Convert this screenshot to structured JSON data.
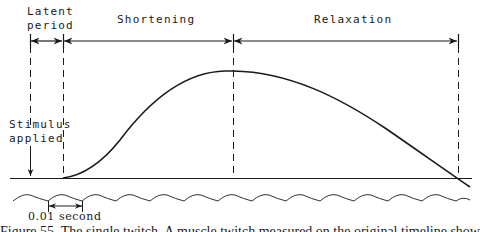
{
  "labels": {
    "latent_line1": "Latent",
    "latent_line2": "period",
    "shortening": "Shortening",
    "relaxation": "Relaxation",
    "stimulus_line1": "Stimulus",
    "stimulus_line2": "applied",
    "time_marker": "0.01 second"
  },
  "caption": "Figure 55. The single twitch. A muscle twitch measured on the original timeline showing latent period, shortening and relaxation",
  "colors": {
    "ink": "#1a1a1a",
    "background": "#ffffff"
  },
  "phases": [
    {
      "name": "Latent period",
      "start_x": 30,
      "end_x": 63
    },
    {
      "name": "Shortening",
      "start_x": 63,
      "end_x": 233
    },
    {
      "name": "Relaxation",
      "start_x": 233,
      "end_x": 458
    }
  ]
}
